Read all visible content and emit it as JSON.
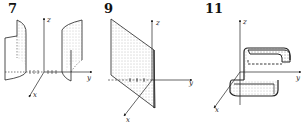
{
  "figures": [
    {
      "number": "7",
      "description": "two vertical cylindrical surface pieces parallel to z-axis, on either side of the z-axis",
      "axes": {
        "x": "x",
        "y": "y",
        "z": "z"
      }
    },
    {
      "number": "9",
      "description": "stippled plane parallel to z-axis crossing the y-axis",
      "axes": {
        "x": "x",
        "y": "y",
        "z": "z"
      }
    },
    {
      "number": "11",
      "description": "stippled S-shaped cylindrical surface parallel to x-axis",
      "axes": {
        "x": "x",
        "y": "y",
        "z": "z"
      }
    }
  ],
  "colors": {
    "ink": "#222222",
    "stipple": "#9a9a9a",
    "background": "#ffffff"
  }
}
